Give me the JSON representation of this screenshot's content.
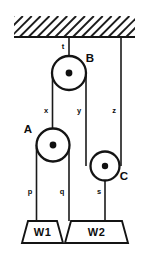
{
  "figure": {
    "type": "free-body-pulley-diagram",
    "background_color": "#ffffff",
    "line_color": "#141414"
  },
  "ceiling": {
    "label": "ceiling",
    "hatching": "diagonal-hatch",
    "hatch_count": 16,
    "x_start": 14,
    "x_end": 135,
    "y_top": 16,
    "y_bottom": 37
  },
  "pulleys": [
    {
      "id": "B",
      "label": "B",
      "cx": 69,
      "cy": 73,
      "r": 17,
      "hub_r": 3.4,
      "label_x": 90,
      "label_y": 62
    },
    {
      "id": "A",
      "label": "A",
      "cx": 53,
      "cy": 145,
      "r": 16.5,
      "hub_r": 3.4,
      "label_x": 28,
      "label_y": 133
    },
    {
      "id": "C",
      "label": "C",
      "cx": 105,
      "cy": 166,
      "r": 14.5,
      "hub_r": 3.2,
      "label_x": 124,
      "label_y": 180
    }
  ],
  "ropes": [
    {
      "id": "t",
      "label": "t",
      "description": "ceiling to pulley B axle",
      "x": 69,
      "y_start": 37,
      "y_end": 73,
      "label_x": 63,
      "label_y": 49
    },
    {
      "id": "x",
      "label": "x",
      "description": "left strand from pulley B down to pulley A axle",
      "x": 52.5,
      "y_start": 73,
      "y_end": 145,
      "label_x": 46,
      "label_y": 113
    },
    {
      "id": "y",
      "label": "y",
      "description": "right strand from pulley B down to pulley C rim",
      "x": 86,
      "y_start": 73,
      "y_end": 166,
      "label_x": 79,
      "label_y": 113
    },
    {
      "id": "z",
      "label": "z",
      "description": "ceiling down to pulley C right rim",
      "x": 121,
      "y_start": 37,
      "y_end": 166,
      "label_x": 114,
      "label_y": 113
    },
    {
      "id": "p",
      "label": "p",
      "description": "pulley A left rim down to weight W1",
      "x": 36.5,
      "y_start": 145,
      "y_end": 221,
      "label_x": 30,
      "label_y": 194
    },
    {
      "id": "q",
      "label": "q",
      "description": "pulley A right rim down to weight W2",
      "x": 69,
      "y_start": 145,
      "y_end": 221,
      "label_x": 62,
      "label_y": 194
    },
    {
      "id": "s",
      "label": "s",
      "description": "pulley C axle down to weight W2",
      "x": 105,
      "y_start": 166,
      "y_end": 221,
      "label_x": 99,
      "label_y": 194
    }
  ],
  "weights": [
    {
      "id": "W1",
      "label": "W1",
      "shape": "trapezoid",
      "top_left": 28,
      "top_right": 57,
      "bottom_left": 22,
      "bottom_right": 63,
      "y_top": 221,
      "y_bottom": 243,
      "label_x": 42.5,
      "label_y": 236
    },
    {
      "id": "W2",
      "label": "W2",
      "shape": "trapezoid",
      "top_left": 71,
      "top_right": 122,
      "bottom_left": 65,
      "bottom_right": 128,
      "y_top": 221,
      "y_bottom": 243,
      "label_x": 96.5,
      "label_y": 236
    }
  ]
}
